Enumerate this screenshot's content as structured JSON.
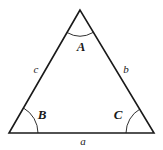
{
  "diagram": {
    "type": "triangle",
    "stroke_color": "#1a1a1a",
    "background": "#ffffff",
    "vertices": {
      "A": {
        "x": 80,
        "y": 10
      },
      "B": {
        "x": 9,
        "y": 133
      },
      "C": {
        "x": 154,
        "y": 133
      }
    },
    "angles": [
      {
        "name": "A",
        "label": "A"
      },
      {
        "name": "B",
        "label": "B"
      },
      {
        "name": "C",
        "label": "C"
      }
    ],
    "sides": [
      {
        "name": "a",
        "label": "a",
        "between": "B-C"
      },
      {
        "name": "b",
        "label": "b",
        "between": "A-C"
      },
      {
        "name": "c",
        "label": "c",
        "between": "A-B"
      }
    ]
  }
}
